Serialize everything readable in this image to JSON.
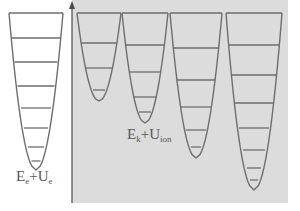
{
  "figure": {
    "title": "",
    "background_color": "#ffffff",
    "panel_right_color": "#dcdcdc",
    "curve_color": "#6e6e6e",
    "level_color": "#6e6e6e",
    "label_color": "#585858",
    "width": 300,
    "height": 211
  },
  "axis": {
    "name": "vertical-energy-axis",
    "x": 72,
    "y_top": 6,
    "y_bottom": 203,
    "arrow_direction": "up",
    "color": "#4a4a4a"
  },
  "labels": {
    "left": {
      "id": "label-electron",
      "parts": [
        {
          "text": "E",
          "type": "base"
        },
        {
          "text": "e",
          "type": "sub"
        },
        {
          "text": "+U",
          "type": "base"
        },
        {
          "text": "e",
          "type": "sub"
        }
      ],
      "plain": "Ee+Ue"
    },
    "right": {
      "id": "label-ion",
      "parts": [
        {
          "text": "E",
          "type": "base"
        },
        {
          "text": "k",
          "type": "sub"
        },
        {
          "text": "+U",
          "type": "base"
        },
        {
          "text": "ion",
          "type": "sub"
        }
      ],
      "plain": "Ek+Uion"
    }
  },
  "chart_data": {
    "type": "diagram",
    "panel_divider_x": 72,
    "well_top_y": 13,
    "wells": [
      {
        "name": "well-1-electron",
        "panel": "left",
        "center_x": 36,
        "half_width_top": 27,
        "top_y": 13,
        "bottom_y": 170,
        "level_count": 7,
        "levels_y": [
          13,
          38,
          62,
          86,
          108,
          128,
          147,
          161
        ],
        "levels_half_width": [
          27,
          24.5,
          21.5,
          18.5,
          15,
          12,
          8,
          4.5
        ]
      },
      {
        "name": "well-2-ion",
        "panel": "right",
        "center_x": 99,
        "half_width_top": 22,
        "top_y": 13,
        "bottom_y": 101,
        "level_count": 3,
        "levels_y": [
          13,
          43,
          68,
          90
        ],
        "levels_half_width": [
          22,
          18,
          13,
          6
        ]
      },
      {
        "name": "well-3-ion",
        "panel": "right",
        "center_x": 145,
        "half_width_top": 23,
        "top_y": 13,
        "bottom_y": 123,
        "level_count": 4,
        "levels_y": [
          13,
          45,
          72,
          97,
          112
        ],
        "levels_half_width": [
          23,
          20,
          16,
          11,
          6
        ]
      },
      {
        "name": "well-4-ion",
        "panel": "right",
        "center_x": 196,
        "half_width_top": 26,
        "top_y": 13,
        "bottom_y": 158,
        "level_count": 5,
        "levels_y": [
          13,
          48,
          80,
          107,
          130,
          147
        ],
        "levels_half_width": [
          26,
          23,
          19.5,
          15,
          10,
          5
        ]
      },
      {
        "name": "well-5-ion",
        "panel": "right",
        "center_x": 254,
        "half_width_top": 28,
        "top_y": 13,
        "bottom_y": 190,
        "level_count": 7,
        "levels_y": [
          13,
          45,
          75,
          103,
          128,
          150,
          168,
          180
        ],
        "levels_half_width": [
          28,
          25.5,
          23,
          19,
          15,
          11,
          7,
          4
        ]
      }
    ]
  }
}
